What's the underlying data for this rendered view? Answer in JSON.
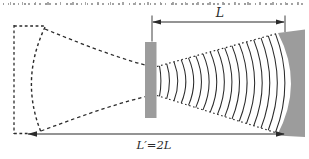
{
  "diagram": {
    "labels": {
      "cavity_length": "L",
      "equivalent_length": "L′=2L"
    },
    "colors": {
      "stroke": "#2b2b2b",
      "mirror_fill": "#9c9c9c",
      "background": "#ffffff"
    },
    "wavefronts": {
      "count": 17,
      "x_start": 159.5,
      "x_end": 275.5
    }
  }
}
